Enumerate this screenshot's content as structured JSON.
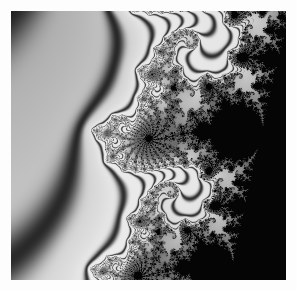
{
  "figure": {
    "title": "Mandelbrot Set Fractal",
    "alt_text": "Grayscale Mandelbrot set fractal zoom showing two large bulbs on a diagonal chain with satellite mini-Mandelbrots and spiral filaments",
    "width_px": 297,
    "height_px": 291,
    "border_px": 11,
    "border_color": "#ffffff"
  },
  "plot": {
    "width_px": 275,
    "height_px": 269,
    "background_color": "#6a6a6a",
    "interior_color": "#141414",
    "halo_color": "#f2f2f2",
    "escape_band_color": "#2a2a2a",
    "outer_gray": "#5b5b5b"
  },
  "chart_data": {
    "type": "heatmap",
    "title": "Mandelbrot Set Fractal",
    "xlabel": "Re(c)",
    "ylabel": "Im(c)",
    "colormap": "grayscale",
    "grid": false,
    "legend": "none",
    "render": {
      "max_iterations": 256,
      "escape_radius": 2.0,
      "smooth_coloring": true,
      "supersample": 2
    },
    "view": {
      "center_re": -0.744,
      "center_im": 0.1475,
      "span_re": 0.026,
      "span_im": 0.0254,
      "xlim": [
        -0.757,
        -0.731
      ],
      "ylim": [
        0.1348,
        0.1602
      ]
    },
    "features": [
      {
        "name": "main-bulb-upper",
        "cx": 0.405,
        "cy": 0.36,
        "r": 0.112,
        "kind": "cardioid-bulb"
      },
      {
        "name": "main-bulb-lower",
        "cx": 0.617,
        "cy": 0.665,
        "r": 0.11,
        "kind": "cardioid-bulb"
      },
      {
        "name": "satellite-left",
        "cx": 0.16,
        "cy": 0.312,
        "r": 0.05,
        "kind": "mini-mandelbrot"
      },
      {
        "name": "satellite-upper-right",
        "cx": 0.482,
        "cy": 0.19,
        "r": 0.042,
        "kind": "mini-mandelbrot"
      },
      {
        "name": "satellite-mid-right",
        "cx": 0.74,
        "cy": 0.43,
        "r": 0.04,
        "kind": "mini-mandelbrot"
      },
      {
        "name": "satellite-lower-right",
        "cx": 0.852,
        "cy": 0.73,
        "r": 0.05,
        "kind": "mini-mandelbrot"
      },
      {
        "name": "satellite-lower-left",
        "cx": 0.3,
        "cy": 0.546,
        "r": 0.036,
        "kind": "mini-mandelbrot"
      },
      {
        "name": "satellite-bottom",
        "cx": 0.512,
        "cy": 0.88,
        "r": 0.034,
        "kind": "mini-mandelbrot"
      },
      {
        "name": "satellite-far-left",
        "cx": 0.062,
        "cy": 0.365,
        "r": 0.022,
        "kind": "mini-mandelbrot"
      },
      {
        "name": "satellite-far-right",
        "cx": 0.968,
        "cy": 0.672,
        "r": 0.024,
        "kind": "mini-mandelbrot"
      }
    ]
  }
}
